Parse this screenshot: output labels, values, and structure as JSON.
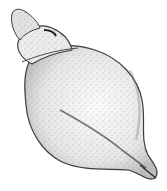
{
  "image": {
    "subject": "seashell-illustration",
    "style": "stippled pen-and-ink drawing",
    "colors": {
      "background": "#ffffff",
      "ink": "#2a2a2a",
      "shade": "#8a8a8a",
      "light": "#f2f2f2"
    }
  }
}
